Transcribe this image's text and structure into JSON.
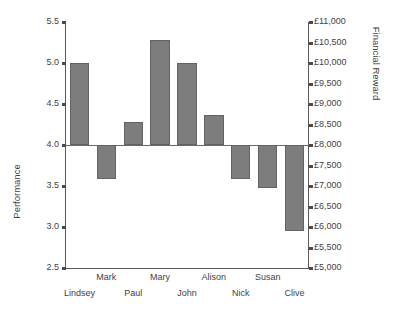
{
  "chart_data": {
    "type": "bar",
    "title": "",
    "subtitle": "",
    "categories": [
      "Lindsey",
      "Mark",
      "Paul",
      "Mary",
      "John",
      "Alison",
      "Nick",
      "Susan",
      "Clive"
    ],
    "values": [
      5.0,
      3.59,
      4.28,
      5.28,
      5.0,
      4.37,
      3.58,
      3.48,
      2.95
    ],
    "series": [
      {
        "name": "Performance",
        "values": [
          5.0,
          3.59,
          4.28,
          5.28,
          5.0,
          4.37,
          3.58,
          3.48,
          2.95
        ]
      }
    ],
    "secondary_values_gbp": [
      10000,
      7090,
      8560,
      10560,
      10000,
      8740,
      7160,
      6960,
      5900
    ],
    "baseline": 4.0,
    "baseline_secondary": 8000,
    "xlabel": "",
    "ylabel": "Performance",
    "ylabel_secondary": "Financial Reward",
    "ylim": [
      2.5,
      5.5
    ],
    "ylim_secondary": [
      5000,
      11000
    ],
    "ytick_step": 0.5,
    "ytick_step_secondary": 500,
    "yticks": [
      "5.5",
      "5.0",
      "4.5",
      "4.0",
      "3.5",
      "3.0",
      "2.5"
    ],
    "yticks_secondary": [
      "£11,000",
      "£10,500",
      "£10,000",
      "£9,500",
      "£9,000",
      "£8,500",
      "£8,000",
      "£7,500",
      "£7,000",
      "£6,500",
      "£6,000",
      "£5,500",
      "£5,000"
    ],
    "grid": false,
    "legend": false,
    "legend_position": "none",
    "bar_color": "#7d7d7d",
    "bar_edge_color": "#636363",
    "axis_color": "#5a5a5a",
    "background_color": "#ffffff"
  }
}
